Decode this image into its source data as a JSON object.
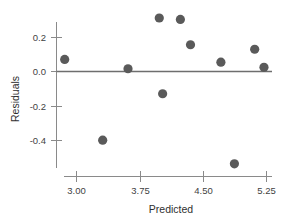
{
  "chart_data": {
    "type": "scatter",
    "title": "",
    "xlabel": "Predicted",
    "ylabel": "Residuals",
    "xlim": [
      2.72,
      5.37
    ],
    "ylim": [
      -0.6,
      0.36
    ],
    "xticks": [
      3.0,
      3.75,
      4.5,
      5.25
    ],
    "xticklabels": [
      "3.00",
      "3.75",
      "4.50",
      "5.25"
    ],
    "yticks": [
      0.2,
      0.0,
      -0.2,
      -0.4
    ],
    "yticklabels": [
      "0.2",
      "0.0",
      "-0.2",
      "-0.4"
    ],
    "grid": false,
    "legend": false,
    "reference_line": {
      "y": 0.0,
      "label": "",
      "color": "#6e6e6e"
    },
    "marker": {
      "shape": "circle",
      "color": "#5a5a5a",
      "size": 4.6
    },
    "x": [
      2.86,
      3.31,
      3.61,
      3.98,
      4.02,
      4.23,
      4.35,
      4.71,
      4.87,
      5.11,
      5.22
    ],
    "y": [
      0.07,
      -0.398,
      0.016,
      0.31,
      -0.129,
      0.302,
      0.155,
      0.054,
      -0.535,
      0.129,
      0.024
    ],
    "points": [
      {
        "x": 2.86,
        "y": 0.07
      },
      {
        "x": 3.31,
        "y": -0.398
      },
      {
        "x": 3.61,
        "y": 0.016
      },
      {
        "x": 3.98,
        "y": 0.31
      },
      {
        "x": 4.02,
        "y": -0.129
      },
      {
        "x": 4.23,
        "y": 0.302
      },
      {
        "x": 4.35,
        "y": 0.155
      },
      {
        "x": 4.71,
        "y": 0.054
      },
      {
        "x": 4.87,
        "y": -0.535
      },
      {
        "x": 5.11,
        "y": 0.129
      },
      {
        "x": 5.22,
        "y": 0.024
      }
    ],
    "n_points": 11,
    "colors": {
      "marker": "#5a5a5a",
      "axis": "#8a8a8a",
      "reference_line": "#6e6e6e",
      "text": "#3f3f3f",
      "background": "#ffffff"
    }
  },
  "axes": {
    "x_title": "Predicted",
    "y_title": "Residuals",
    "x_tick_labels": [
      "3.00",
      "3.75",
      "4.50",
      "5.25"
    ],
    "y_tick_labels": [
      "0.2",
      "0.0",
      "-0.2",
      "-0.4"
    ]
  }
}
